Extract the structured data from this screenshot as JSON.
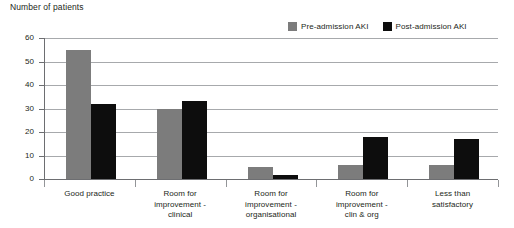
{
  "chart": {
    "axis_title": "Number of patients"
  },
  "legend": {
    "position": "top-right",
    "entries": [
      {
        "label": "Pre-admission AKI",
        "color": "#7c7c7c",
        "swatch_name": "legend-swatch-pre-admission"
      },
      {
        "label": "Post-admission AKI",
        "color": "#0d0d0d",
        "swatch_name": "legend-swatch-post-admission"
      }
    ]
  },
  "chart_data": {
    "type": "bar",
    "title": "",
    "xlabel": "",
    "ylabel": "Number of patients",
    "ylim": [
      0,
      60
    ],
    "yticks": [
      0,
      10,
      20,
      30,
      40,
      50,
      60
    ],
    "ytick_labels": [
      "0",
      "10",
      "20",
      "30",
      "40",
      "50",
      "60"
    ],
    "grid": true,
    "legend_position": "top-right",
    "categories": [
      "Good practice",
      "Room for improvement - clinical",
      "Room for improvement - organisational",
      "Room for improvement - clin & org",
      "Less than satisfactory"
    ],
    "category_lines": [
      [
        "Good practice"
      ],
      [
        "Room for",
        "improvement -",
        "clinical"
      ],
      [
        "Room for",
        "improvement -",
        "organisational"
      ],
      [
        "Room for",
        "improvement -",
        "clin & org"
      ],
      [
        "Less than",
        "satisfactory"
      ]
    ],
    "series": [
      {
        "name": "Pre-admission AKI",
        "color": "#7c7c7c",
        "values": [
          55,
          30,
          5,
          6,
          6
        ]
      },
      {
        "name": "Post-admission AKI",
        "color": "#0d0d0d",
        "values": [
          32,
          33,
          1.5,
          18,
          17
        ]
      }
    ]
  }
}
